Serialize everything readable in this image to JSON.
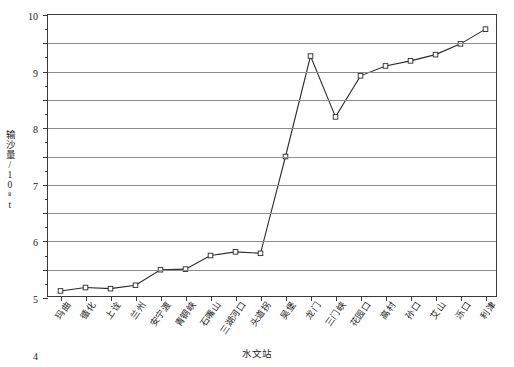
{
  "chart_data": {
    "type": "line",
    "title": "",
    "xlabel": "水文站",
    "ylabel": "输沙量/10⁸t",
    "ylim": [
      0,
      10
    ],
    "ytick_step": 1,
    "yminor_step": 0.5,
    "grid": true,
    "legend": "none",
    "marker": "open-square",
    "line_color": "#2b2b2b",
    "grid_color": "#8d8d8d",
    "axis_color": "#3a3a3a",
    "categories": [
      "玛曲",
      "循化",
      "上诠",
      "兰州",
      "安宁渡",
      "青铜峡",
      "石嘴山",
      "三湖河口",
      "头道拐",
      "吴堡",
      "龙门",
      "三门峡",
      "花园口",
      "高村",
      "孙口",
      "艾山",
      "泺口",
      "利津"
    ],
    "ytick_labels": [
      "0",
      "1",
      "2",
      "3",
      "4",
      "5",
      "6",
      "7",
      "8",
      "9",
      "10"
    ],
    "series": [
      {
        "name": "输沙量",
        "values": [
          0.25,
          0.37,
          0.33,
          0.45,
          1.0,
          1.02,
          1.5,
          1.63,
          1.58,
          5.0,
          8.55,
          6.4,
          7.85,
          8.2,
          8.38,
          8.6,
          8.98,
          9.5
        ]
      }
    ]
  }
}
